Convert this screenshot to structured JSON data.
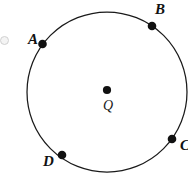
{
  "figure": {
    "type": "geometry-circle-diagram",
    "background_color": "#ffffff",
    "stroke_color": "#1a1a1a",
    "point_color": "#111111",
    "canvas": {
      "width": 188,
      "height": 180
    },
    "circle": {
      "center_x": 107,
      "center_y": 92,
      "radius": 80,
      "stroke_width": 1.2,
      "clipped_right_edge": true
    },
    "center_point": {
      "label": "Q",
      "x": 107,
      "y": 90,
      "dot_radius": 4,
      "label_x": 103,
      "label_y": 99
    },
    "points": [
      {
        "label": "A",
        "x": 42.5,
        "y": 44,
        "dot_radius": 4,
        "label_x": 28,
        "label_y": 32
      },
      {
        "label": "B",
        "x": 152,
        "y": 26,
        "dot_radius": 4,
        "label_x": 155,
        "label_y": 2
      },
      {
        "label": "C",
        "x": 172,
        "y": 139,
        "dot_radius": 4,
        "label_x": 180,
        "label_y": 138
      },
      {
        "label": "D",
        "x": 62,
        "y": 155,
        "dot_radius": 4,
        "label_x": 43,
        "label_y": 154
      }
    ],
    "edge_mark": {
      "x": 1,
      "y": 36
    }
  }
}
